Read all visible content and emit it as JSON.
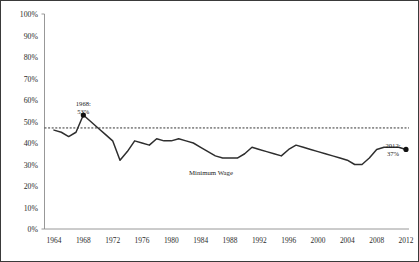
{
  "chart_data": {
    "type": "line",
    "title": "",
    "subtitle": "",
    "xlabel": "",
    "ylabel": "",
    "xlim": [
      1964,
      2012
    ],
    "ylim": [
      0,
      100
    ],
    "grid": false,
    "legend_position": "inline-annotation",
    "y_tick_labels": [
      "100%",
      "90%",
      "80%",
      "70%",
      "60%",
      "50%",
      "40%",
      "30%",
      "20%",
      "10%",
      "0%"
    ],
    "y_tick_values": [
      100,
      90,
      80,
      70,
      60,
      50,
      40,
      30,
      20,
      10,
      0
    ],
    "x_tick_labels": [
      "1964",
      "1968",
      "1972",
      "1976",
      "1980",
      "1984",
      "1988",
      "1992",
      "1996",
      "2000",
      "2004",
      "2008",
      "2012"
    ],
    "x_tick_values": [
      1964,
      1968,
      1972,
      1976,
      1980,
      1984,
      1988,
      1992,
      1996,
      2000,
      2004,
      2008,
      2012
    ],
    "series": [
      {
        "name": "Minimum Wage",
        "color": "#2e2e2e",
        "x": [
          1964,
          1965,
          1966,
          1967,
          1968,
          1969,
          1970,
          1971,
          1972,
          1973,
          1974,
          1975,
          1976,
          1977,
          1978,
          1979,
          1980,
          1981,
          1982,
          1983,
          1984,
          1985,
          1986,
          1987,
          1988,
          1989,
          1990,
          1991,
          1992,
          1993,
          1994,
          1995,
          1996,
          1997,
          1998,
          1999,
          2000,
          2001,
          2002,
          2003,
          2004,
          2005,
          2006,
          2007,
          2008,
          2009,
          2010,
          2011,
          2012
        ],
        "values": [
          46,
          45,
          43,
          45,
          53,
          50,
          47,
          44,
          41,
          32,
          36,
          41,
          40,
          39,
          42,
          41,
          41,
          42,
          41,
          40,
          38,
          36,
          34,
          33,
          33,
          33,
          35,
          38,
          37,
          36,
          35,
          34,
          37,
          39,
          38,
          37,
          36,
          35,
          34,
          33,
          32,
          30,
          30,
          33,
          37,
          38,
          38,
          38,
          37
        ]
      }
    ],
    "reference_line": {
      "name": "1968 level reference",
      "value": 47,
      "style": "dashed",
      "color": "#1c1c1c"
    },
    "annotations": [
      {
        "id": "peak-1968",
        "text_line1": "1968:",
        "text_line2": "53%",
        "x": 1968,
        "y": 53,
        "marker": true
      },
      {
        "id": "end-2012",
        "text_line1": "2012:",
        "text_line2": "37%",
        "x": 2012,
        "y": 37,
        "marker": true
      },
      {
        "id": "series-inline-label",
        "text_line1": "Minimum Wage",
        "text_line2": "",
        "x": 1987,
        "y": 26,
        "marker": false
      }
    ]
  }
}
